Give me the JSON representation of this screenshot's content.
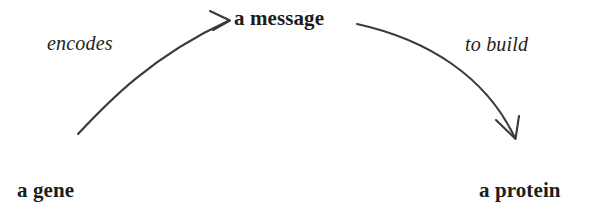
{
  "diagram": {
    "background_color": "#ffffff",
    "stroke_color": "#3a3a3a",
    "text_color": "#1d1d1d",
    "nodes": [
      {
        "id": "gene",
        "label": "a gene",
        "style": "bold"
      },
      {
        "id": "message",
        "label": "a message",
        "style": "bold"
      },
      {
        "id": "protein",
        "label": "a protein",
        "style": "bold"
      }
    ],
    "edges": [
      {
        "id": "encodes",
        "label": "encodes",
        "style": "italic",
        "from": "gene",
        "to": "message",
        "arrowhead": "open-v",
        "direction": "up-right"
      },
      {
        "id": "to-build",
        "label": "to build",
        "style": "italic",
        "from": "message",
        "to": "protein",
        "arrowhead": "open-v",
        "direction": "down-right"
      }
    ]
  }
}
